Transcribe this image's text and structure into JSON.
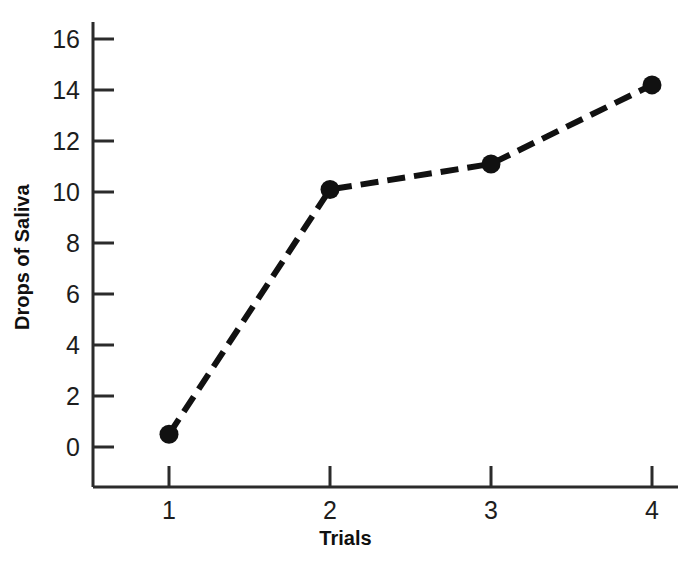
{
  "chart_data": {
    "type": "line",
    "title": "",
    "subtitle": "",
    "xlabel": "Trials",
    "ylabel": "Drops of Saliva",
    "x": [
      1,
      2,
      3,
      4
    ],
    "values": [
      0.5,
      10.1,
      11.1,
      14.2
    ],
    "series": [
      {
        "name": "Drops of Saliva",
        "values": [
          0.5,
          10.1,
          11.1,
          14.2
        ]
      }
    ],
    "xtick_labels": [
      "1",
      "2",
      "3",
      "4"
    ],
    "ytick_labels": [
      "0",
      "2",
      "4",
      "6",
      "8",
      "10",
      "12",
      "14",
      "16"
    ],
    "ytick_values": [
      0,
      2,
      4,
      6,
      8,
      10,
      12,
      14,
      16
    ],
    "xlim": [
      0.5,
      4.35
    ],
    "ylim": [
      -1.55,
      17.0
    ],
    "grid": false,
    "legend": false,
    "legend_position": "none",
    "line_style": "dashed",
    "marker": "filled-circle",
    "line_color": "#111111",
    "marker_color": "#111111",
    "axis_color": "#2b2b2b",
    "background_color": "#ffffff"
  },
  "axes": {
    "y_title": "Drops of Saliva",
    "x_title": "Trials"
  }
}
